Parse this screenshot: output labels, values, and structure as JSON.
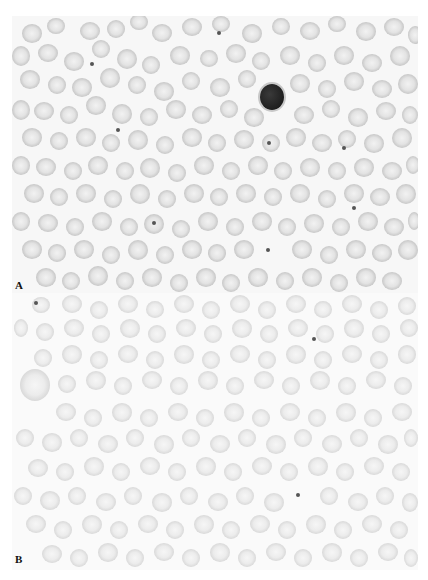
{
  "figure": {
    "panels": [
      {
        "id": "A",
        "label": "A"
      },
      {
        "id": "B",
        "label": "B"
      }
    ]
  },
  "panel_a": {
    "label": "A",
    "lymphocyte": {
      "x": 248,
      "y": 68,
      "w": 24,
      "h": 26
    },
    "dots": [
      [
        78,
        46
      ],
      [
        104,
        112
      ],
      [
        205,
        15
      ],
      [
        140,
        205
      ],
      [
        254,
        232
      ],
      [
        255,
        125
      ],
      [
        340,
        190
      ],
      [
        330,
        130
      ]
    ],
    "cells": [
      [
        10,
        8,
        20,
        19
      ],
      [
        35,
        2,
        18,
        16
      ],
      [
        68,
        6,
        20,
        18
      ],
      [
        95,
        4,
        18,
        18
      ],
      [
        118,
        -2,
        18,
        16
      ],
      [
        140,
        8,
        20,
        18
      ],
      [
        170,
        2,
        20,
        18
      ],
      [
        200,
        0,
        18,
        16
      ],
      [
        230,
        8,
        20,
        19
      ],
      [
        260,
        2,
        18,
        17
      ],
      [
        288,
        6,
        20,
        18
      ],
      [
        316,
        0,
        18,
        16
      ],
      [
        344,
        6,
        20,
        19
      ],
      [
        372,
        2,
        20,
        18
      ],
      [
        396,
        10,
        14,
        18
      ],
      [
        0,
        30,
        18,
        20
      ],
      [
        26,
        28,
        20,
        18
      ],
      [
        52,
        36,
        20,
        19
      ],
      [
        80,
        24,
        18,
        18
      ],
      [
        105,
        33,
        20,
        20
      ],
      [
        130,
        40,
        18,
        18
      ],
      [
        158,
        30,
        20,
        19
      ],
      [
        188,
        34,
        18,
        17
      ],
      [
        214,
        28,
        20,
        19
      ],
      [
        240,
        36,
        18,
        18
      ],
      [
        268,
        30,
        20,
        19
      ],
      [
        296,
        38,
        18,
        18
      ],
      [
        322,
        30,
        20,
        19
      ],
      [
        350,
        38,
        20,
        18
      ],
      [
        378,
        30,
        20,
        20
      ],
      [
        8,
        54,
        20,
        19
      ],
      [
        36,
        60,
        18,
        18
      ],
      [
        60,
        62,
        20,
        19
      ],
      [
        88,
        52,
        20,
        20
      ],
      [
        116,
        60,
        18,
        18
      ],
      [
        142,
        66,
        20,
        19
      ],
      [
        170,
        56,
        18,
        18
      ],
      [
        198,
        62,
        20,
        19
      ],
      [
        226,
        54,
        18,
        18
      ],
      [
        278,
        58,
        20,
        19
      ],
      [
        306,
        64,
        18,
        18
      ],
      [
        332,
        56,
        20,
        19
      ],
      [
        360,
        64,
        20,
        18
      ],
      [
        386,
        58,
        20,
        20
      ],
      [
        0,
        84,
        18,
        20
      ],
      [
        22,
        86,
        20,
        18
      ],
      [
        48,
        90,
        18,
        18
      ],
      [
        74,
        80,
        20,
        19
      ],
      [
        100,
        88,
        20,
        20
      ],
      [
        128,
        92,
        18,
        18
      ],
      [
        154,
        84,
        20,
        19
      ],
      [
        180,
        90,
        20,
        18
      ],
      [
        208,
        84,
        18,
        18
      ],
      [
        232,
        92,
        20,
        19
      ],
      [
        282,
        90,
        20,
        18
      ],
      [
        310,
        84,
        18,
        18
      ],
      [
        336,
        92,
        20,
        19
      ],
      [
        364,
        86,
        20,
        18
      ],
      [
        390,
        90,
        16,
        18
      ],
      [
        10,
        112,
        20,
        19
      ],
      [
        38,
        116,
        18,
        18
      ],
      [
        64,
        112,
        20,
        19
      ],
      [
        90,
        118,
        18,
        18
      ],
      [
        116,
        114,
        20,
        20
      ],
      [
        144,
        120,
        18,
        18
      ],
      [
        170,
        112,
        20,
        19
      ],
      [
        196,
        118,
        18,
        18
      ],
      [
        222,
        114,
        20,
        19
      ],
      [
        250,
        118,
        18,
        18
      ],
      [
        274,
        112,
        20,
        19
      ],
      [
        300,
        118,
        20,
        18
      ],
      [
        326,
        114,
        18,
        18
      ],
      [
        352,
        118,
        20,
        19
      ],
      [
        380,
        112,
        20,
        20
      ],
      [
        0,
        140,
        18,
        19
      ],
      [
        24,
        142,
        20,
        18
      ],
      [
        52,
        146,
        18,
        18
      ],
      [
        76,
        140,
        20,
        19
      ],
      [
        104,
        146,
        18,
        18
      ],
      [
        128,
        142,
        20,
        20
      ],
      [
        156,
        148,
        18,
        18
      ],
      [
        182,
        140,
        20,
        19
      ],
      [
        210,
        146,
        18,
        18
      ],
      [
        236,
        140,
        20,
        19
      ],
      [
        262,
        146,
        18,
        18
      ],
      [
        288,
        142,
        20,
        19
      ],
      [
        316,
        146,
        18,
        18
      ],
      [
        342,
        142,
        20,
        19
      ],
      [
        370,
        146,
        20,
        18
      ],
      [
        394,
        140,
        14,
        18
      ],
      [
        12,
        168,
        20,
        19
      ],
      [
        38,
        172,
        18,
        18
      ],
      [
        64,
        168,
        20,
        19
      ],
      [
        92,
        174,
        18,
        18
      ],
      [
        118,
        168,
        20,
        20
      ],
      [
        146,
        174,
        18,
        18
      ],
      [
        172,
        168,
        20,
        19
      ],
      [
        198,
        172,
        18,
        18
      ],
      [
        224,
        168,
        20,
        19
      ],
      [
        252,
        172,
        18,
        18
      ],
      [
        278,
        168,
        20,
        19
      ],
      [
        306,
        174,
        18,
        18
      ],
      [
        332,
        168,
        20,
        19
      ],
      [
        358,
        172,
        20,
        18
      ],
      [
        384,
        168,
        20,
        20
      ],
      [
        0,
        196,
        18,
        19
      ],
      [
        26,
        198,
        20,
        18
      ],
      [
        54,
        202,
        18,
        18
      ],
      [
        80,
        196,
        20,
        19
      ],
      [
        108,
        202,
        18,
        18
      ],
      [
        132,
        198,
        20,
        20
      ],
      [
        160,
        204,
        18,
        18
      ],
      [
        186,
        196,
        20,
        19
      ],
      [
        214,
        202,
        18,
        18
      ],
      [
        240,
        196,
        20,
        19
      ],
      [
        266,
        202,
        18,
        18
      ],
      [
        292,
        198,
        20,
        19
      ],
      [
        320,
        202,
        18,
        18
      ],
      [
        346,
        196,
        20,
        19
      ],
      [
        372,
        202,
        20,
        18
      ],
      [
        396,
        196,
        12,
        18
      ],
      [
        10,
        224,
        20,
        19
      ],
      [
        36,
        228,
        18,
        18
      ],
      [
        62,
        224,
        20,
        19
      ],
      [
        90,
        230,
        18,
        18
      ],
      [
        116,
        224,
        20,
        20
      ],
      [
        144,
        230,
        18,
        18
      ],
      [
        170,
        224,
        20,
        19
      ],
      [
        196,
        228,
        18,
        18
      ],
      [
        222,
        224,
        20,
        19
      ],
      [
        280,
        224,
        20,
        19
      ],
      [
        308,
        230,
        18,
        18
      ],
      [
        334,
        224,
        20,
        19
      ],
      [
        360,
        228,
        20,
        18
      ],
      [
        386,
        224,
        20,
        20
      ],
      [
        24,
        252,
        20,
        19
      ],
      [
        50,
        256,
        18,
        18
      ],
      [
        76,
        250,
        20,
        20
      ],
      [
        104,
        256,
        18,
        18
      ],
      [
        130,
        252,
        20,
        19
      ],
      [
        158,
        258,
        18,
        18
      ],
      [
        184,
        252,
        20,
        19
      ],
      [
        210,
        258,
        18,
        18
      ],
      [
        236,
        252,
        20,
        19
      ],
      [
        264,
        256,
        18,
        18
      ],
      [
        290,
        252,
        20,
        19
      ],
      [
        318,
        258,
        18,
        18
      ],
      [
        344,
        252,
        20,
        19
      ],
      [
        370,
        256,
        20,
        18
      ]
    ]
  },
  "panel_b": {
    "label": "B",
    "large_cell": {
      "x": 8,
      "y": 76,
      "w": 30,
      "h": 32
    },
    "dots": [
      [
        22,
        8
      ],
      [
        284,
        200
      ],
      [
        300,
        44
      ]
    ],
    "cells": [
      [
        20,
        4,
        18,
        16
      ],
      [
        50,
        2,
        20,
        18
      ],
      [
        78,
        8,
        18,
        18
      ],
      [
        106,
        2,
        20,
        18
      ],
      [
        134,
        8,
        18,
        17
      ],
      [
        162,
        2,
        20,
        18
      ],
      [
        190,
        8,
        18,
        18
      ],
      [
        218,
        2,
        20,
        18
      ],
      [
        246,
        8,
        18,
        18
      ],
      [
        274,
        2,
        20,
        18
      ],
      [
        302,
        8,
        18,
        17
      ],
      [
        330,
        2,
        20,
        18
      ],
      [
        358,
        8,
        18,
        18
      ],
      [
        386,
        4,
        18,
        18
      ],
      [
        2,
        26,
        14,
        18
      ],
      [
        24,
        30,
        18,
        18
      ],
      [
        52,
        26,
        20,
        18
      ],
      [
        80,
        32,
        18,
        18
      ],
      [
        108,
        26,
        20,
        19
      ],
      [
        136,
        32,
        18,
        18
      ],
      [
        164,
        26,
        20,
        18
      ],
      [
        192,
        32,
        18,
        18
      ],
      [
        220,
        26,
        20,
        19
      ],
      [
        248,
        32,
        18,
        18
      ],
      [
        276,
        26,
        20,
        18
      ],
      [
        304,
        32,
        18,
        18
      ],
      [
        332,
        26,
        20,
        19
      ],
      [
        360,
        32,
        18,
        18
      ],
      [
        388,
        26,
        18,
        18
      ],
      [
        22,
        56,
        18,
        18
      ],
      [
        50,
        52,
        20,
        19
      ],
      [
        78,
        58,
        18,
        18
      ],
      [
        106,
        52,
        20,
        18
      ],
      [
        134,
        58,
        18,
        18
      ],
      [
        162,
        52,
        20,
        19
      ],
      [
        190,
        58,
        18,
        18
      ],
      [
        218,
        52,
        20,
        18
      ],
      [
        246,
        58,
        18,
        18
      ],
      [
        274,
        52,
        20,
        19
      ],
      [
        302,
        58,
        18,
        18
      ],
      [
        330,
        52,
        20,
        18
      ],
      [
        358,
        58,
        18,
        18
      ],
      [
        386,
        52,
        18,
        19
      ],
      [
        46,
        82,
        18,
        18
      ],
      [
        74,
        78,
        20,
        19
      ],
      [
        102,
        84,
        18,
        18
      ],
      [
        130,
        78,
        20,
        18
      ],
      [
        158,
        84,
        18,
        18
      ],
      [
        186,
        78,
        20,
        19
      ],
      [
        214,
        84,
        18,
        18
      ],
      [
        242,
        78,
        20,
        18
      ],
      [
        270,
        84,
        18,
        18
      ],
      [
        298,
        78,
        20,
        19
      ],
      [
        326,
        84,
        18,
        18
      ],
      [
        354,
        78,
        20,
        18
      ],
      [
        382,
        84,
        18,
        18
      ],
      [
        44,
        110,
        20,
        18
      ],
      [
        72,
        116,
        18,
        18
      ],
      [
        100,
        110,
        20,
        19
      ],
      [
        128,
        116,
        18,
        18
      ],
      [
        156,
        110,
        20,
        18
      ],
      [
        184,
        116,
        18,
        18
      ],
      [
        212,
        110,
        20,
        19
      ],
      [
        240,
        116,
        18,
        18
      ],
      [
        268,
        110,
        20,
        18
      ],
      [
        296,
        116,
        18,
        18
      ],
      [
        324,
        110,
        20,
        19
      ],
      [
        352,
        116,
        18,
        18
      ],
      [
        380,
        110,
        20,
        18
      ],
      [
        4,
        136,
        18,
        18
      ],
      [
        30,
        140,
        20,
        19
      ],
      [
        58,
        136,
        18,
        18
      ],
      [
        86,
        142,
        20,
        18
      ],
      [
        114,
        136,
        18,
        18
      ],
      [
        142,
        142,
        20,
        19
      ],
      [
        170,
        136,
        18,
        18
      ],
      [
        198,
        142,
        20,
        18
      ],
      [
        226,
        136,
        18,
        18
      ],
      [
        254,
        142,
        20,
        19
      ],
      [
        282,
        136,
        18,
        18
      ],
      [
        310,
        142,
        20,
        18
      ],
      [
        338,
        136,
        18,
        18
      ],
      [
        366,
        142,
        20,
        19
      ],
      [
        392,
        136,
        14,
        18
      ],
      [
        16,
        166,
        20,
        18
      ],
      [
        44,
        170,
        18,
        18
      ],
      [
        72,
        164,
        20,
        19
      ],
      [
        100,
        170,
        18,
        18
      ],
      [
        128,
        164,
        20,
        18
      ],
      [
        156,
        170,
        18,
        18
      ],
      [
        184,
        164,
        20,
        19
      ],
      [
        212,
        170,
        18,
        18
      ],
      [
        240,
        164,
        20,
        18
      ],
      [
        268,
        170,
        18,
        18
      ],
      [
        296,
        164,
        20,
        19
      ],
      [
        324,
        170,
        18,
        18
      ],
      [
        352,
        164,
        20,
        18
      ],
      [
        380,
        170,
        18,
        18
      ],
      [
        2,
        194,
        18,
        18
      ],
      [
        28,
        198,
        20,
        19
      ],
      [
        56,
        194,
        18,
        18
      ],
      [
        84,
        200,
        20,
        18
      ],
      [
        112,
        194,
        18,
        18
      ],
      [
        140,
        200,
        20,
        19
      ],
      [
        168,
        194,
        18,
        18
      ],
      [
        196,
        200,
        20,
        18
      ],
      [
        224,
        194,
        18,
        18
      ],
      [
        252,
        200,
        20,
        19
      ],
      [
        308,
        194,
        18,
        18
      ],
      [
        336,
        200,
        20,
        18
      ],
      [
        364,
        194,
        18,
        18
      ],
      [
        390,
        200,
        16,
        19
      ],
      [
        14,
        222,
        20,
        18
      ],
      [
        42,
        228,
        18,
        18
      ],
      [
        70,
        222,
        20,
        19
      ],
      [
        98,
        228,
        18,
        18
      ],
      [
        126,
        222,
        20,
        18
      ],
      [
        154,
        228,
        18,
        18
      ],
      [
        182,
        222,
        20,
        19
      ],
      [
        210,
        228,
        18,
        18
      ],
      [
        238,
        222,
        20,
        18
      ],
      [
        266,
        228,
        18,
        18
      ],
      [
        294,
        222,
        20,
        19
      ],
      [
        322,
        228,
        18,
        18
      ],
      [
        350,
        222,
        20,
        18
      ],
      [
        378,
        228,
        18,
        18
      ],
      [
        30,
        252,
        20,
        18
      ],
      [
        58,
        256,
        18,
        18
      ],
      [
        86,
        250,
        20,
        19
      ],
      [
        114,
        256,
        18,
        18
      ],
      [
        142,
        250,
        20,
        18
      ],
      [
        170,
        256,
        18,
        18
      ],
      [
        198,
        250,
        20,
        19
      ],
      [
        226,
        256,
        18,
        18
      ],
      [
        254,
        250,
        20,
        18
      ],
      [
        282,
        256,
        18,
        18
      ],
      [
        310,
        250,
        20,
        19
      ],
      [
        338,
        256,
        18,
        18
      ],
      [
        366,
        250,
        20,
        18
      ],
      [
        392,
        256,
        14,
        18
      ]
    ]
  }
}
